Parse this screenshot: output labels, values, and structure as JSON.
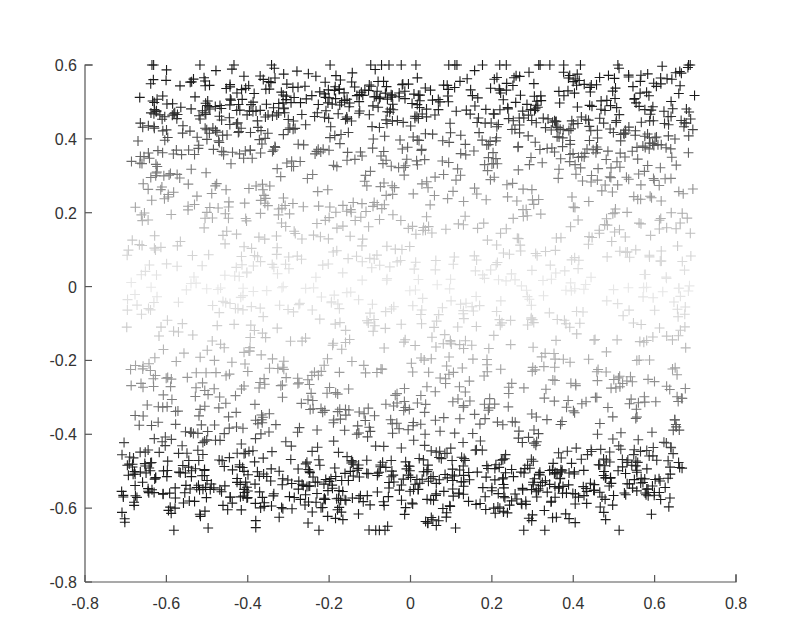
{
  "chart_data": {
    "type": "scatter",
    "title": "",
    "xlabel": "",
    "ylabel": "",
    "xlim": [
      -0.8,
      0.8
    ],
    "ylim": [
      -0.8,
      0.6
    ],
    "grid": false,
    "legend": null,
    "marker": "+",
    "color_encoding": "gray intensity increases with |y| (dark near y=±0.5, very light near y=0)",
    "x_ticks": [
      -0.8,
      -0.6,
      -0.4,
      -0.2,
      0,
      0.2,
      0.4,
      0.6,
      0.8
    ],
    "x_tick_labels": [
      "-0.8",
      "-0.6",
      "-0.4",
      "-0.2",
      "0",
      "0.2",
      "0.4",
      "0.6",
      "0.8"
    ],
    "y_ticks": [
      0.6,
      0.4,
      0.2,
      0,
      -0.2,
      -0.4,
      -0.6,
      -0.8
    ],
    "y_tick_labels": [
      "0.6",
      "0.4",
      "0.2",
      "0",
      "-0.2",
      "-0.4",
      "-0.6",
      "-0.8"
    ],
    "series": [
      {
        "name": "upper band",
        "count": 620,
        "x_range": [
          -0.67,
          0.7
        ],
        "y_center": 0.47,
        "y_spread": 0.075,
        "y_max": 0.6,
        "darkness": "dark"
      },
      {
        "name": "upper transition",
        "count": 260,
        "x_range": [
          -0.69,
          0.7
        ],
        "y_range": [
          0.15,
          0.38
        ],
        "darkness": "medium"
      },
      {
        "name": "middle band",
        "count": 420,
        "x_range": [
          -0.7,
          0.69
        ],
        "y_range": [
          -0.22,
          0.15
        ],
        "darkness": "light"
      },
      {
        "name": "lower transition",
        "count": 260,
        "x_range": [
          -0.69,
          0.68
        ],
        "y_range": [
          -0.4,
          -0.22
        ],
        "darkness": "medium"
      },
      {
        "name": "lower band",
        "count": 620,
        "x_range": [
          -0.71,
          0.67
        ],
        "y_center": -0.52,
        "y_spread": 0.065,
        "y_min": -0.66,
        "darkness": "dark"
      }
    ],
    "approx_total_points": 2180
  },
  "plot_area_px": {
    "left": 85,
    "right": 736,
    "top": 65,
    "bottom": 582
  },
  "colors": {
    "axis": "#555555",
    "label": "#333333",
    "marker_darkest": "#1a1a1a",
    "marker_lightest": "#e6e6e6"
  }
}
